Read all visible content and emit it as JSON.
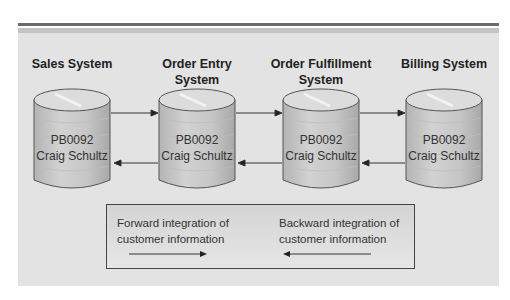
{
  "diagram": {
    "systems": [
      {
        "title_line1": "",
        "title_line2": "Sales System",
        "record_id": "PB0092",
        "customer_name": "Craig Schultz"
      },
      {
        "title_line1": "Order Entry",
        "title_line2": "System",
        "record_id": "PB0092",
        "customer_name": "Craig Schultz"
      },
      {
        "title_line1": "Order Fulfillment",
        "title_line2": "System",
        "record_id": "PB0092",
        "customer_name": "Craig Schultz"
      },
      {
        "title_line1": "",
        "title_line2": "Billing System",
        "record_id": "PB0092",
        "customer_name": "Craig Schultz"
      }
    ],
    "legend": {
      "forward_line1": "Forward integration of",
      "forward_line2": "customer information",
      "backward_line1": "Backward integration of",
      "backward_line2": "customer information"
    },
    "colors": {
      "panel_bg": "#e3e3e3",
      "cylinder_fill": "#c8c8c8",
      "arrow": "#222222"
    }
  }
}
